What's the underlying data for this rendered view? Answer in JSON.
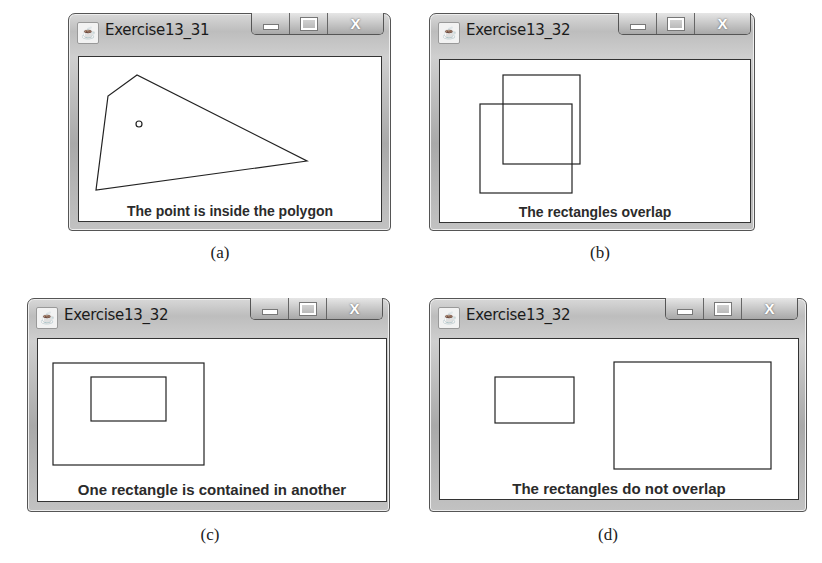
{
  "panels": [
    {
      "id": "a",
      "window_title": "Exercise13_31",
      "status_text": "The point is inside the polygon",
      "caption": "(a)",
      "shapes": {
        "polygon": "42,10 13,31 1,125 212,96",
        "point": {
          "cx": 44,
          "cy": 59,
          "r": 3
        }
      }
    },
    {
      "id": "b",
      "window_title": "Exercise13_32",
      "status_text": "The rectangles overlap",
      "caption": "(b)",
      "shapes": {
        "rects": [
          {
            "x": 63,
            "y": 15,
            "w": 77,
            "h": 89
          },
          {
            "x": 40,
            "y": 44,
            "w": 92,
            "h": 89
          }
        ]
      }
    },
    {
      "id": "c",
      "window_title": "Exercise13_32",
      "status_text": "One rectangle is contained in another",
      "caption": "(c)",
      "shapes": {
        "rects": [
          {
            "x": 15,
            "y": 24,
            "w": 151,
            "h": 102
          },
          {
            "x": 53,
            "y": 38,
            "w": 75,
            "h": 44
          }
        ]
      }
    },
    {
      "id": "d",
      "window_title": "Exercise13_32",
      "status_text": "The rectangles do not overlap",
      "caption": "(d)",
      "shapes": {
        "rects": [
          {
            "x": 55,
            "y": 38,
            "w": 79,
            "h": 46
          },
          {
            "x": 174,
            "y": 23,
            "w": 157,
            "h": 107
          }
        ]
      }
    }
  ],
  "window_controls": {
    "minimize": "minimize",
    "maximize": "maximize",
    "close": "X"
  }
}
